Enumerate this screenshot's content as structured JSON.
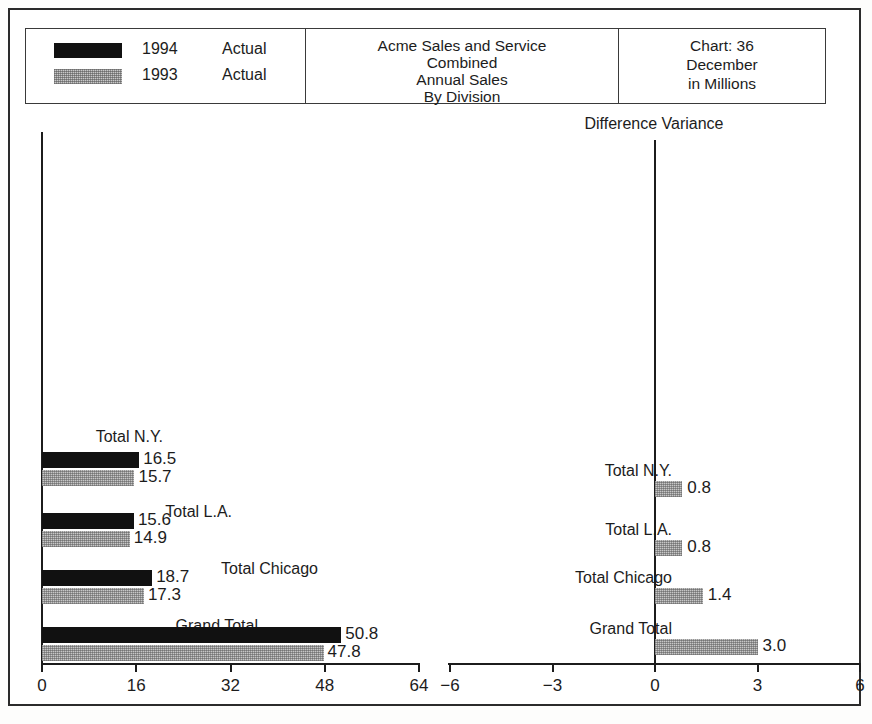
{
  "legend": {
    "rows": [
      {
        "swatch": "black",
        "year": "1994",
        "kind": "Actual"
      },
      {
        "swatch": "gray",
        "year": "1993",
        "kind": "Actual"
      }
    ]
  },
  "title": {
    "lines": [
      "Acme Sales and Service",
      "Combined",
      "Annual Sales",
      "By Division"
    ]
  },
  "info": {
    "lines": [
      "Chart:   36",
      "December",
      "in Millions"
    ]
  },
  "right_panel": {
    "header": "Difference Variance"
  },
  "chart_data": {
    "type": "bar",
    "title": "Acme Sales and Service Combined Annual Sales By Division",
    "orientation": "horizontal",
    "categories": [
      "Total N.Y.",
      "Total L.A.",
      "Total Chicago",
      "Grand Total"
    ],
    "series": [
      {
        "name": "1994 Actual",
        "color": "#111111",
        "values": [
          16.5,
          15.6,
          18.7,
          50.8
        ]
      },
      {
        "name": "1993 Actual",
        "color": "#c7c7c7",
        "values": [
          15.7,
          14.9,
          17.3,
          47.8
        ]
      }
    ],
    "value_labels": [
      [
        "16.5",
        "15.7"
      ],
      [
        "15.6",
        "14.9"
      ],
      [
        "18.7",
        "17.3"
      ],
      [
        "50.8",
        "47.8"
      ]
    ],
    "xlabel": "",
    "ylabel": "",
    "xlim": [
      0,
      64
    ],
    "xticks": [
      0,
      16,
      32,
      48,
      64
    ],
    "xtick_labels": [
      "0",
      "16",
      "32",
      "48",
      "64"
    ],
    "grid": false,
    "legend_position": "top-left",
    "secondary_chart": {
      "type": "bar",
      "title": "Difference Variance",
      "orientation": "horizontal",
      "categories": [
        "Total N.Y.",
        "Total L.A.",
        "Total Chicago",
        "Grand Total"
      ],
      "values": [
        0.8,
        0.8,
        1.4,
        3.0
      ],
      "value_labels": [
        "0.8",
        "0.8",
        "1.4",
        "3.0"
      ],
      "color": "#c7c7c7",
      "xlim": [
        -6,
        6
      ],
      "xticks": [
        -6,
        -3,
        0,
        3,
        6
      ],
      "xtick_labels": [
        "−6",
        "−3",
        "0",
        "3",
        "6"
      ],
      "grid": false
    }
  }
}
